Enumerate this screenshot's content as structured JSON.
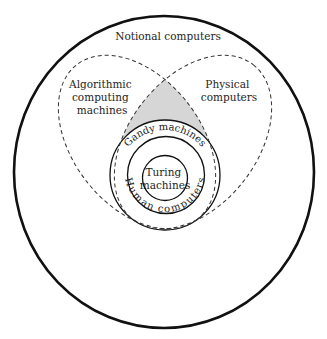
{
  "diagram": {
    "type": "nested-set-diagram",
    "colors": {
      "stroke": "#111111",
      "shaded_region": "#d6d6d6",
      "background": "#ffffff",
      "text": "#1e1e1e"
    },
    "sets": [
      {
        "id": "notional",
        "label": "Notional computers",
        "style": "solid-thick"
      },
      {
        "id": "algorithmic",
        "label_lines": [
          "Algorithmic",
          "computing",
          "machines"
        ],
        "style": "dashed"
      },
      {
        "id": "physical",
        "label_lines": [
          "Physical",
          "computers"
        ],
        "style": "dashed"
      },
      {
        "id": "gandy",
        "label": "Gandy machines",
        "style": "solid"
      },
      {
        "id": "human",
        "label": "Human computers",
        "style": "solid"
      },
      {
        "id": "turing",
        "label_lines": [
          "Turing",
          "machines"
        ],
        "style": "solid"
      }
    ],
    "shaded_region": "intersection of Algorithmic computing machines and Physical computers outside Gandy machines"
  }
}
